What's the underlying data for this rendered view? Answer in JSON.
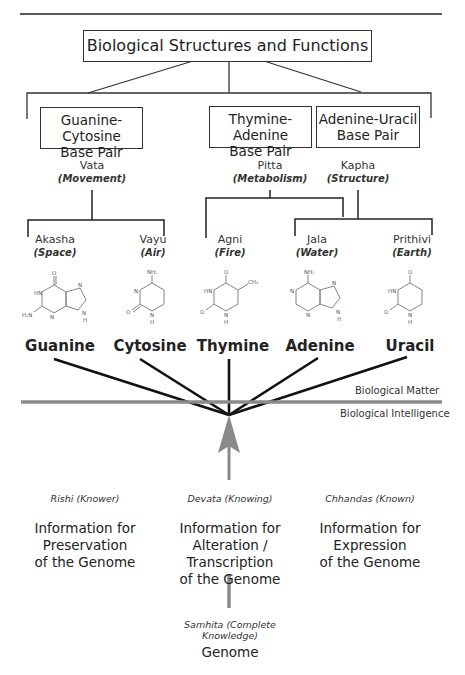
{
  "header": {
    "title": "Biological Structures and Functions"
  },
  "base_pairs": [
    {
      "line1": "Guanine-Cytosine",
      "line2": "Base Pair"
    },
    {
      "line1": "Thymine-Adenine",
      "line2": "Base Pair"
    },
    {
      "line1": "Adenine-Uracil",
      "line2": "Base Pair"
    }
  ],
  "doshas": [
    {
      "name": "Vata",
      "meaning": "(Movement)"
    },
    {
      "name": "Pitta",
      "meaning": "(Metabolism)"
    },
    {
      "name": "Kapha",
      "meaning": "(Structure)"
    }
  ],
  "elements": [
    {
      "name": "Akasha",
      "meaning": "(Space)"
    },
    {
      "name": "Vayu",
      "meaning": "(Air)"
    },
    {
      "name": "Agni",
      "meaning": "(Fire)"
    },
    {
      "name": "Jala",
      "meaning": "(Water)"
    },
    {
      "name": "Prithivi",
      "meaning": "(Earth)"
    }
  ],
  "bases": [
    "Guanine",
    "Cytosine",
    "Thymine",
    "Adenine",
    "Uracil"
  ],
  "molecule_labels": {
    "hn": "HN",
    "nh": "N",
    "h": "H",
    "o": "O",
    "n": "N",
    "h2n": "H₂N",
    "nh2": "NH₂",
    "ch3": "CH₃"
  },
  "divider": {
    "above": "Biological Matter",
    "below": "Biological Intelligence"
  },
  "aspects": [
    {
      "label": "Rishi (Knower)",
      "info": [
        "Information for",
        "Preservation",
        "of the Genome"
      ]
    },
    {
      "label": "Devata (Knowing)",
      "info": [
        "Information for",
        "Alteration / Transcription",
        "of the Genome"
      ]
    },
    {
      "label": "Chhandas (Known)",
      "info": [
        "Information for",
        "Expression",
        "of the Genome"
      ]
    }
  ],
  "samhita": {
    "label": "Samhita (Complete Knowledge)",
    "name": "Genome"
  },
  "colors": {
    "line": "#1a1a1a",
    "gray": "#888888"
  }
}
